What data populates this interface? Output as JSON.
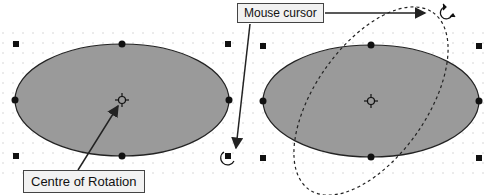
{
  "annotations": {
    "mouse_cursor": "Mouse cursor",
    "centre_of_rotation": "Centre of Rotation"
  },
  "colors": {
    "ellipse_fill": "#9a9a9a",
    "ellipse_stroke": "#222222",
    "handle": "#111111",
    "grid_dot": "#c8c8c8"
  },
  "icons": [
    "rotate-cursor-icon",
    "centre-of-rotation-icon",
    "selection-handle-icon"
  ]
}
